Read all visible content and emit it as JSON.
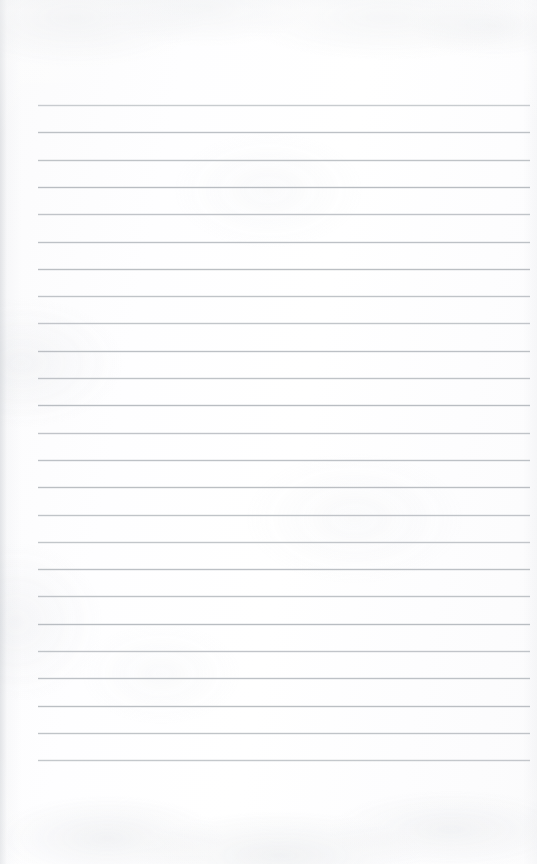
{
  "document": {
    "type": "scanned-blank-ruled-notepad-page",
    "title": "Blank lined notepad page",
    "page_width": 537,
    "page_height": 864,
    "orientation": "portrait",
    "has_text_content": false,
    "text_content": "",
    "paper_color": "#fdfdfe",
    "background_color": "#ffffff"
  },
  "ruling": {
    "label": "Horizontal ruled writing lines",
    "line_color": "#b9bdc2",
    "line_thickness_px": 1,
    "line_count": 25,
    "line_left_x": 38,
    "line_right_x": 530,
    "line_length_px": 492,
    "first_line_y": 105,
    "last_line_y": 760,
    "line_spacing_px": 27.3,
    "lines_y": [
      105,
      132.3,
      159.6,
      186.9,
      214.2,
      241.5,
      268.8,
      296.1,
      323.4,
      350.7,
      378,
      405.3,
      432.6,
      459.9,
      487.2,
      514.5,
      541.8,
      569.1,
      596.4,
      623.7,
      651,
      678.3,
      705.6,
      732.9,
      760.2
    ]
  },
  "margins": {
    "top_margin_px": 105,
    "bottom_margin_px": 104,
    "left_margin_px": 38,
    "right_margin_px": 7
  }
}
